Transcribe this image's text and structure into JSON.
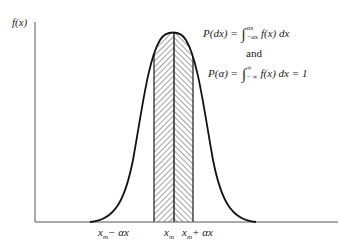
{
  "figure": {
    "y_axis_label": "f(x)",
    "equations": {
      "eq1": {
        "lhs": "P(dx) =",
        "integral": "∫",
        "upper": "αx",
        "lower": "−αx",
        "rhs": "f(x) dx"
      },
      "connector": "and",
      "eq2": {
        "lhs": "P(α) =",
        "integral": "∫",
        "upper": "∞",
        "lower": "− ∞",
        "rhs": "f(x) dx = 1"
      }
    },
    "x_ticks": {
      "left": {
        "base": "x",
        "sub": "m",
        "suffix": "− αx"
      },
      "mid": {
        "base": "x",
        "sub": "m",
        "suffix": ""
      },
      "right": {
        "base": "x",
        "sub": "m",
        "suffix": "+ αx"
      }
    },
    "colors": {
      "ink": "#1a1a1a",
      "axis": "#555555",
      "background": "#ffffff"
    }
  }
}
